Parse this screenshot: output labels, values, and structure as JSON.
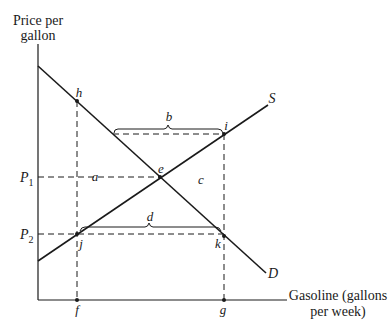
{
  "axes": {
    "y_label_line1": "Price per",
    "y_label_line2": "gallon",
    "x_label_line1": "Gasoline (gallons",
    "x_label_line2": "per week)"
  },
  "curves": {
    "supply": "S",
    "demand": "D"
  },
  "prices": {
    "p1_main": "P",
    "p1_sub": "1",
    "p2_main": "P",
    "p2_sub": "2"
  },
  "points": {
    "h": "h",
    "i": "i",
    "e": "e",
    "j": "j",
    "k": "k",
    "f": "f",
    "g": "g"
  },
  "areas": {
    "a": "a",
    "b": "b",
    "c": "c",
    "d": "d"
  },
  "colors": {
    "line": "#1a1a1a",
    "background": "#ffffff"
  }
}
